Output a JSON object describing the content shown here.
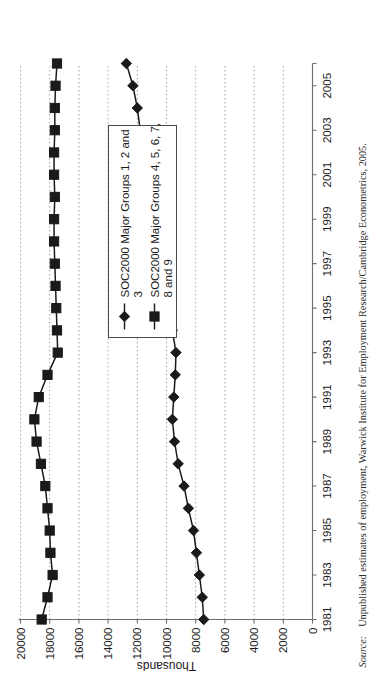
{
  "figure": {
    "source_label": "Source:",
    "source_text": "Unpublished estimates of employment, Warwick Institute for Employment Research/Cambridge Econometrics, 2005."
  },
  "chart_data": {
    "type": "line",
    "title": "",
    "xlabel": "",
    "ylabel": "Thousands",
    "ylim": [
      0,
      20000
    ],
    "xlim": [
      1981,
      2006
    ],
    "grid": true,
    "orientation": "rotated-90-ccw",
    "legend_position": "inside-right",
    "yticks": [
      "0",
      "2000",
      "4000",
      "6000",
      "8000",
      "10000",
      "12000",
      "14000",
      "16000",
      "18000",
      "20000"
    ],
    "ytick_values": [
      0,
      2000,
      4000,
      6000,
      8000,
      10000,
      12000,
      14000,
      16000,
      18000,
      20000
    ],
    "xticks": [
      "1981",
      "1983",
      "1985",
      "1987",
      "1989",
      "1991",
      "1993",
      "1995",
      "1997",
      "1999",
      "2001",
      "2003",
      "2005"
    ],
    "xtick_values": [
      1981,
      1983,
      1985,
      1987,
      1989,
      1991,
      1993,
      1995,
      1997,
      1999,
      2001,
      2003,
      2005
    ],
    "x": [
      1981,
      1982,
      1983,
      1984,
      1985,
      1986,
      1987,
      1988,
      1989,
      1990,
      1991,
      1992,
      1993,
      1994,
      1995,
      1996,
      1997,
      1998,
      1999,
      2000,
      2001,
      2002,
      2003,
      2004,
      2005,
      2006
    ],
    "series": [
      {
        "name": "SOC2000 Major Groups 1, 2 and 3",
        "marker": "diamond",
        "values": [
          7450,
          7550,
          7750,
          7950,
          8150,
          8500,
          8800,
          9200,
          9450,
          9600,
          9500,
          9400,
          9350,
          9600,
          9850,
          10150,
          10450,
          10750,
          11000,
          11250,
          11500,
          11650,
          11800,
          12000,
          12300,
          12750
        ]
      },
      {
        "name": "SOC2000 Major Groups 4, 5, 6, 7, 8 and 9",
        "marker": "square",
        "values": [
          18550,
          18150,
          17800,
          17950,
          18000,
          18150,
          18300,
          18600,
          18900,
          19050,
          18750,
          18150,
          17450,
          17500,
          17550,
          17600,
          17650,
          17700,
          17700,
          17650,
          17700,
          17700,
          17650,
          17650,
          17600,
          17500
        ]
      }
    ],
    "legend_entries": [
      {
        "label_line1": "SOC2000 Major Groups 1, 2 and",
        "label_line2": "3",
        "marker": "diamond"
      },
      {
        "label_line1": "SOC2000 Major Groups 4, 5, 6, 7,",
        "label_line2": "8 and 9",
        "marker": "square"
      }
    ]
  }
}
